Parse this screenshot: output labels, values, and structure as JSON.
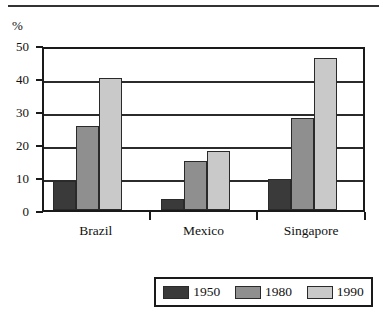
{
  "chart_data": {
    "type": "bar",
    "title": "",
    "subtitle": "",
    "xlabel": "",
    "ylabel": "%",
    "ylim": [
      0,
      50
    ],
    "yticks": [
      0,
      10,
      20,
      30,
      40,
      50
    ],
    "ytick_labels": [
      "0",
      "10",
      "20",
      "30",
      "40",
      "50"
    ],
    "grid": true,
    "grid_axis": "y",
    "legend_position": "bottom",
    "categories": [
      "Brazil",
      "Mexico",
      "Singapore"
    ],
    "series": [
      {
        "name": "1950",
        "color": "#3a3a3a",
        "values": [
          8.7,
          3.2,
          9.5
        ]
      },
      {
        "name": "1980",
        "color": "#8f8f8f",
        "values": [
          25.5,
          15.0,
          28.0
        ]
      },
      {
        "name": "1990",
        "color": "#c9c9c9",
        "values": [
          40.0,
          18.0,
          46.0
        ]
      }
    ],
    "annotations": []
  },
  "axis": {
    "unit_label": "%"
  },
  "legend": {
    "entries": [
      {
        "label": "1950"
      },
      {
        "label": "1980"
      },
      {
        "label": "1990"
      }
    ]
  }
}
